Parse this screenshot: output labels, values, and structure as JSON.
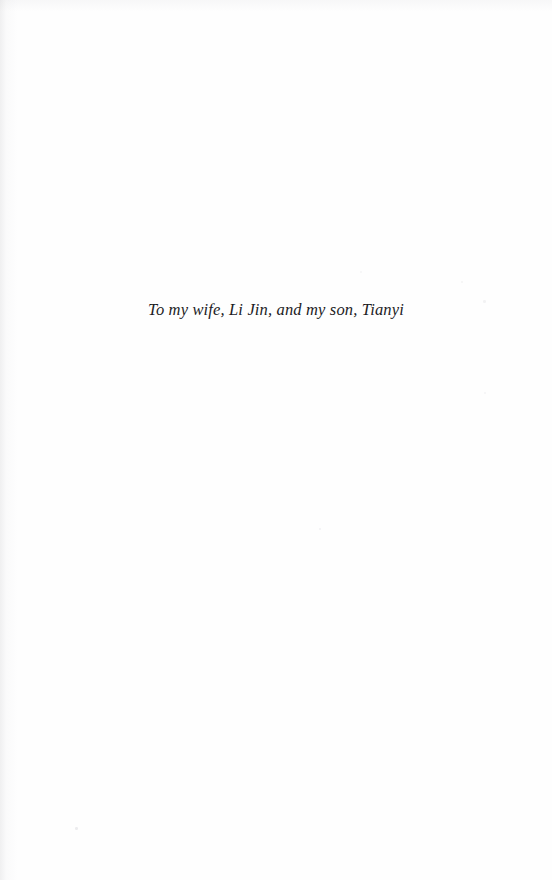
{
  "page": {
    "kind": "book-dedication-page",
    "background_color": "#fefefe",
    "text_color": "#1c1c1e",
    "width": 552,
    "height": 880
  },
  "dedication": {
    "text": "To my wife, Li Jin, and my son, Tianyi"
  },
  "artifacts": {
    "specks": [
      {
        "x": 75,
        "y": 827,
        "size": 2.5,
        "opacity": 0.45
      },
      {
        "x": 319,
        "y": 528,
        "size": 2.0,
        "opacity": 0.32
      },
      {
        "x": 461,
        "y": 281,
        "size": 2.2,
        "opacity": 0.28
      },
      {
        "x": 483,
        "y": 300,
        "size": 2.6,
        "opacity": 0.3
      },
      {
        "x": 484,
        "y": 392,
        "size": 2.0,
        "opacity": 0.25
      },
      {
        "x": 360,
        "y": 271,
        "size": 1.8,
        "opacity": 0.22
      }
    ]
  }
}
